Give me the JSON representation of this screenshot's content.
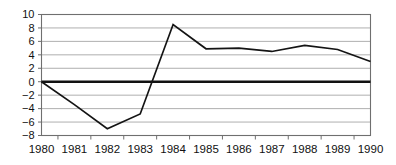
{
  "chart_data": {
    "type": "line",
    "title": "",
    "subtitle": "",
    "xlabel": "",
    "ylabel": "",
    "categories": [
      "1980",
      "1981",
      "1982",
      "1983",
      "1984",
      "1985",
      "1986",
      "1987",
      "1988",
      "1989",
      "1990"
    ],
    "x": [
      1980,
      1981,
      1982,
      1983,
      1984,
      1985,
      1986,
      1987,
      1988,
      1989,
      1990
    ],
    "values": [
      0,
      -3.4,
      -7.0,
      -4.8,
      8.5,
      4.9,
      5.0,
      4.5,
      5.4,
      4.8,
      3.0
    ],
    "series": [
      {
        "name": "",
        "values": [
          0,
          -3.4,
          -7.0,
          -4.8,
          8.5,
          4.9,
          5.0,
          4.5,
          5.4,
          4.8,
          3.0
        ]
      }
    ],
    "ylim": [
      -8,
      10
    ],
    "xlim": [
      1980,
      1990
    ],
    "ytick_values": [
      10,
      8,
      6,
      4,
      2,
      0,
      -2,
      -4,
      -6,
      -8
    ],
    "ytick_labels": [
      "10",
      "8",
      "6",
      "4",
      "2",
      "0",
      "−2",
      "−4",
      "−6",
      "−8"
    ],
    "xtick_labels": [
      "1980",
      "1981",
      "1982",
      "1983",
      "1984",
      "1985",
      "1986",
      "1987",
      "1988",
      "1989",
      "1990"
    ],
    "grid": true,
    "grid_axis": "y",
    "legend": false,
    "legend_position": "none",
    "zero_line": true,
    "annotations": [],
    "colors": {
      "line": "#141414",
      "grid": "#9a9a9a",
      "frame": "#6f6f6f",
      "zero_line": "#111111",
      "background": "#ffffff",
      "text": "#111111"
    }
  }
}
